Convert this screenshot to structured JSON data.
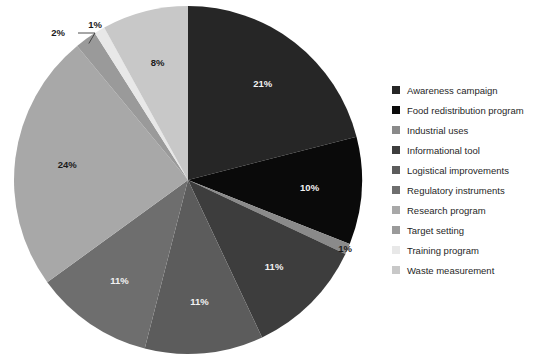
{
  "chart_data": {
    "type": "pie",
    "title": "",
    "subtitle": "",
    "xlabel": "",
    "ylabel": "",
    "grid": false,
    "legend_position": "right",
    "start_angle_deg": 0,
    "direction": "clockwise",
    "center": {
      "cx": 188,
      "cy": 180,
      "r": 174
    },
    "labels": [
      "Awareness campaign",
      "Food redistribution program",
      "Industrial uses",
      "Informational tool",
      "Logistical improvements",
      "Regulatory instruments",
      "Research program",
      "Target setting",
      "Training program",
      "Waste measurement"
    ],
    "values": [
      21,
      10,
      1,
      11,
      11,
      11,
      24,
      2,
      1,
      8
    ],
    "value_labels": [
      "21%",
      "10%",
      "1%",
      "11%",
      "11%",
      "11%",
      "24%",
      "2%",
      "1%",
      "8%"
    ],
    "colors": [
      "#262626",
      "#0a0a0a",
      "#8a8a8a",
      "#3d3d3d",
      "#5c5c5c",
      "#6e6e6e",
      "#a8a8a8",
      "#9a9a9a",
      "#e8e8e8",
      "#c8c8c8"
    ],
    "label_text_colors": [
      "light",
      "light",
      "dark",
      "light",
      "light",
      "light",
      "dark",
      "dark",
      "dark",
      "dark"
    ],
    "label_placement": [
      "inside",
      "inside",
      "outside",
      "inside",
      "inside",
      "inside",
      "inside",
      "outside",
      "outside",
      "inside"
    ],
    "annotations": [
      {
        "name": "leader-line-target-setting",
        "for": "2%"
      }
    ]
  },
  "legend": {
    "items": [
      {
        "label": "Awareness campaign",
        "color": "#262626"
      },
      {
        "label": "Food redistribution program",
        "color": "#0a0a0a"
      },
      {
        "label": "Industrial uses",
        "color": "#8a8a8a"
      },
      {
        "label": "Informational tool",
        "color": "#3d3d3d"
      },
      {
        "label": "Logistical improvements",
        "color": "#5c5c5c"
      },
      {
        "label": "Regulatory instruments",
        "color": "#6e6e6e"
      },
      {
        "label": "Research program",
        "color": "#a8a8a8"
      },
      {
        "label": "Target setting",
        "color": "#9a9a9a"
      },
      {
        "label": "Training program",
        "color": "#e8e8e8"
      },
      {
        "label": "Waste measurement",
        "color": "#c8c8c8"
      }
    ]
  },
  "background": "#ffffff"
}
